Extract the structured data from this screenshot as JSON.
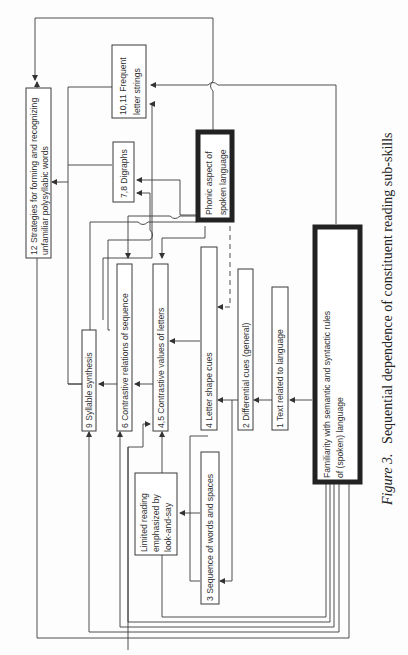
{
  "figure": {
    "caption_prefix": "Figure 3.",
    "caption_text": "Sequential dependence of constituent reading sub-skills",
    "orientation": "rotated 90° counter-clockwise"
  },
  "nodes": {
    "n12": {
      "line1": "12 Strategies for forming and recognizing",
      "line2": "unfamiliar polysyllabic words"
    },
    "n1011": {
      "line1": "10,11  Frequent",
      "line2": "letter strings"
    },
    "n78": {
      "line1": "7,8 Digraphs"
    },
    "phonic": {
      "line1": "Phonic aspect of",
      "line2": "spoken language"
    },
    "n9": {
      "line1": "9 Syllable synthesis"
    },
    "n6": {
      "line1": "6 Contrastive relations of sequence"
    },
    "n45": {
      "line1": "4,5 Contrastive values of letters"
    },
    "n4": {
      "line1": "4 Letter shape cues"
    },
    "n2": {
      "line1": "2 Differential cues (general)"
    },
    "n1": {
      "line1": "1 Text related to language"
    },
    "familiarity": {
      "line1": "Familiarity with semantic and syntactic rules",
      "line2": "of (spoken) language"
    },
    "limited": {
      "line1": "Limited reading",
      "line2": "emphasized by",
      "line3": "look-and-say"
    },
    "n3": {
      "line1": "3 Sequence of words and spaces"
    }
  },
  "edges": [
    {
      "from": "familiarity",
      "to": "n1"
    },
    {
      "from": "n1",
      "to": "n2"
    },
    {
      "from": "n2",
      "to": "n4"
    },
    {
      "from": "n2",
      "to": "n3"
    },
    {
      "from": "n4",
      "to": "n45"
    },
    {
      "from": "n4",
      "to": "n3"
    },
    {
      "from": "n3",
      "to": "limited"
    },
    {
      "from": "n45",
      "to": "n6"
    },
    {
      "from": "n6",
      "to": "n9"
    },
    {
      "from": "n9",
      "to": "n12"
    },
    {
      "from": "n78",
      "to": "n12"
    },
    {
      "from": "n1011",
      "to": "n12"
    },
    {
      "from": "phonic",
      "to": "n12"
    },
    {
      "from": "phonic",
      "to": "n4",
      "style": "dashed"
    },
    {
      "from": "phonic",
      "to": "n45"
    },
    {
      "from": "phonic",
      "to": "n6"
    },
    {
      "from": "phonic",
      "to": "n78"
    },
    {
      "from": "phonic",
      "to": "n9"
    },
    {
      "from": "familiarity",
      "to": "n1011"
    },
    {
      "from": "familiarity",
      "to": "n9"
    },
    {
      "from": "familiarity",
      "to": "n6"
    },
    {
      "from": "familiarity",
      "to": "n45"
    },
    {
      "from": "familiarity",
      "to": "n12"
    }
  ]
}
